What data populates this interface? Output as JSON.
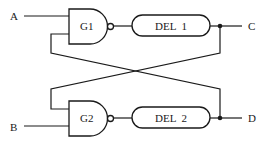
{
  "diagram": {
    "type": "logic-circuit",
    "inputs": [
      {
        "id": "A",
        "label": "A"
      },
      {
        "id": "B",
        "label": "B"
      }
    ],
    "outputs": [
      {
        "id": "C",
        "label": "C"
      },
      {
        "id": "D",
        "label": "D"
      }
    ],
    "gates": [
      {
        "id": "G1",
        "label": "G1",
        "type": "NAND"
      },
      {
        "id": "G2",
        "label": "G2",
        "type": "NAND"
      }
    ],
    "delays": [
      {
        "id": "DEL1",
        "label": "DEL  1"
      },
      {
        "id": "DEL2",
        "label": "DEL  2"
      }
    ],
    "connections": [
      "A -> G1.in1",
      "G1.out -> DEL1",
      "DEL1 -> C",
      "C -> G2.in1 (cross feedback)",
      "B -> G2.in2",
      "G2.out -> DEL2",
      "DEL2 -> D",
      "D -> G1.in2 (cross feedback)"
    ],
    "colors": {
      "line": "#1a1a1a",
      "background": "#ffffff"
    }
  }
}
